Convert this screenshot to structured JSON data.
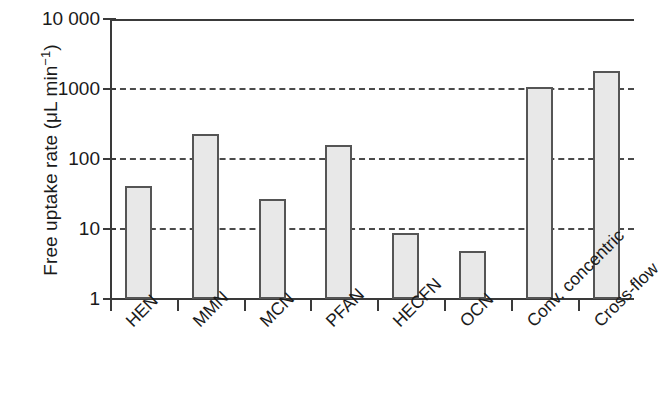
{
  "chart_data": {
    "type": "bar",
    "title": "",
    "xlabel": "",
    "ylabel": "Free uptake rate (μL min⁻¹)",
    "ylabel_parts": {
      "prefix": "Free uptake rate (μL min",
      "exponent": "−1",
      "suffix": ")"
    },
    "yscale": "log",
    "ylim": [
      1,
      10000
    ],
    "ytick_labels": [
      "10 000",
      "1000",
      "100",
      "10",
      "1"
    ],
    "ytick_values": [
      10000,
      1000,
      100,
      10,
      1
    ],
    "grid": true,
    "grid_style": "dashed",
    "grid_axis": "y",
    "legend": "none",
    "categories": [
      "HEN",
      "MMN",
      "MCN",
      "PFAN",
      "HECFN",
      "OCN",
      "Conv. concentric",
      "Cross-flow"
    ],
    "values": [
      41,
      228,
      27,
      158,
      8.7,
      4.9,
      1070,
      1800
    ],
    "bar_color": "#e8e8e8",
    "bar_edge_color": "#555555",
    "axis_color": "#3a3a3a",
    "background_color": "#ffffff"
  },
  "figure": {
    "width": 634,
    "height": 418
  }
}
